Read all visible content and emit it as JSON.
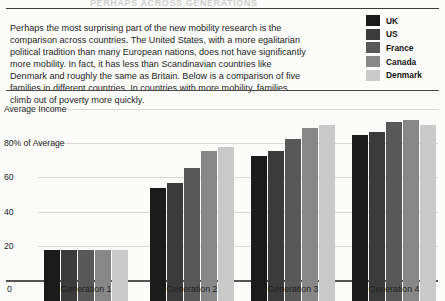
{
  "page": {
    "title_partial": "PERHAPS ACROSS GENERATIONS",
    "background": "#fbfbf9"
  },
  "intro": {
    "text": "Perhaps the most surprising part of the new mobility research is the comparison across countries. The United States, with a more egalitarian political tradition than many European nations, does not have significantly more mobility. In fact, it has less than Scandinavian countries like Denmark and roughly the same as Britain. Below is a comparison of five families in different countries. In countries with more mobility, families climb out of poverty more quickly."
  },
  "legend": {
    "position": "top-right",
    "items": [
      {
        "label": "UK",
        "color": "#1b1b1b"
      },
      {
        "label": "US",
        "color": "#3b3b3b"
      },
      {
        "label": "France",
        "color": "#585858"
      },
      {
        "label": "Canada",
        "color": "#878787"
      },
      {
        "label": "Denmark",
        "color": "#c9c9c9"
      }
    ]
  },
  "chart_data": {
    "type": "bar",
    "title": "",
    "xlabel": "",
    "ylabel": "Average Income",
    "ylim": [
      0,
      110
    ],
    "grid": true,
    "legend_position": "top-right",
    "categories": [
      "Generation 1",
      "Generation 2",
      "Generation 3",
      "Generation 4"
    ],
    "y_ticks": [
      {
        "value": 0,
        "label": "0"
      },
      {
        "value": 20,
        "label": "20"
      },
      {
        "value": 40,
        "label": "40"
      },
      {
        "value": 60,
        "label": "60"
      },
      {
        "value": 80,
        "label": "80% of Average"
      },
      {
        "value": 100,
        "label": "Average Income"
      }
    ],
    "series": [
      {
        "name": "UK",
        "color": "#1b1b1b",
        "values": [
          30,
          66,
          85,
          97
        ]
      },
      {
        "name": "US",
        "color": "#3b3b3b",
        "values": [
          30,
          69,
          88,
          99
        ]
      },
      {
        "name": "France",
        "color": "#585858",
        "values": [
          30,
          78,
          95,
          105
        ]
      },
      {
        "name": "Canada",
        "color": "#878787",
        "values": [
          30,
          88,
          101,
          106
        ]
      },
      {
        "name": "Denmark",
        "color": "#c9c9c9",
        "values": [
          30,
          90,
          103,
          103
        ]
      }
    ]
  }
}
